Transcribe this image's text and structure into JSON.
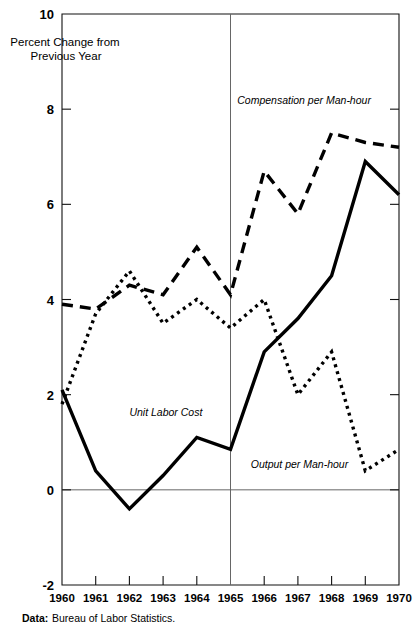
{
  "chart_data": {
    "type": "line",
    "title": "",
    "ylabel": "Percent Change from Previous Year",
    "xlabel": "",
    "x": [
      1960,
      1961,
      1962,
      1963,
      1964,
      1965,
      1966,
      1967,
      1968,
      1969,
      1970
    ],
    "xticklabels": [
      "1960",
      "1961",
      "1962",
      "1963",
      "1964",
      "1965",
      "1966",
      "1967",
      "1968",
      "1969",
      "1970"
    ],
    "yticklabels": [
      "10",
      "8",
      "6",
      "4",
      "2",
      "0",
      "-2"
    ],
    "ytickvalues": [
      10,
      8,
      6,
      4,
      2,
      0,
      -2
    ],
    "ylim": [
      -2,
      10
    ],
    "xlim": [
      1960,
      1970
    ],
    "grid": false,
    "legend_position": "inline-annotations",
    "annotations": [
      {
        "text": "Compensation per Man-hour",
        "x": 1965.2,
        "y": 8.1
      },
      {
        "text": "Unit Labor Cost",
        "x": 1962.0,
        "y": 1.55
      },
      {
        "text": "Output per Man-hour",
        "x": 1965.6,
        "y": 0.45
      }
    ],
    "series": [
      {
        "name": "Compensation per Man-hour",
        "style": "dashed",
        "values": [
          3.9,
          3.8,
          4.3,
          4.1,
          5.1,
          4.1,
          6.7,
          5.8,
          7.5,
          7.3,
          7.2
        ]
      },
      {
        "name": "Output per Man-hour",
        "style": "dotted",
        "values": [
          1.8,
          3.7,
          4.6,
          3.5,
          4.0,
          3.4,
          4.0,
          2.0,
          2.9,
          0.4,
          0.85
        ]
      },
      {
        "name": "Unit Labor Cost",
        "style": "solid",
        "values": [
          2.1,
          0.4,
          -0.4,
          0.3,
          1.1,
          0.85,
          2.9,
          3.6,
          4.5,
          6.9,
          6.2
        ]
      }
    ],
    "divider_x": 1965,
    "zero_reference_line": 0
  },
  "axis_title": {
    "line1": "Percent Change from",
    "line2": "Previous Year"
  },
  "source": {
    "label": "Data:",
    "text": "Bureau of Labor Statistics."
  }
}
